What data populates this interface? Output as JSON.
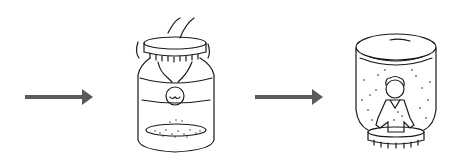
{
  "illustration": {
    "description": "Snow globe craft steps: arrow, upside-down jar with figure attached to lid and glitter at bottom, arrow, finished snow globe standing on lid with figure and falling snow",
    "arrow_color": "#5a5a5a",
    "line_color": "#1a1a1a",
    "steps": [
      {
        "label": "arrow-1"
      },
      {
        "label": "jar-upside-down-with-figure-on-lid"
      },
      {
        "label": "arrow-2"
      },
      {
        "label": "finished-snow-globe"
      }
    ]
  }
}
